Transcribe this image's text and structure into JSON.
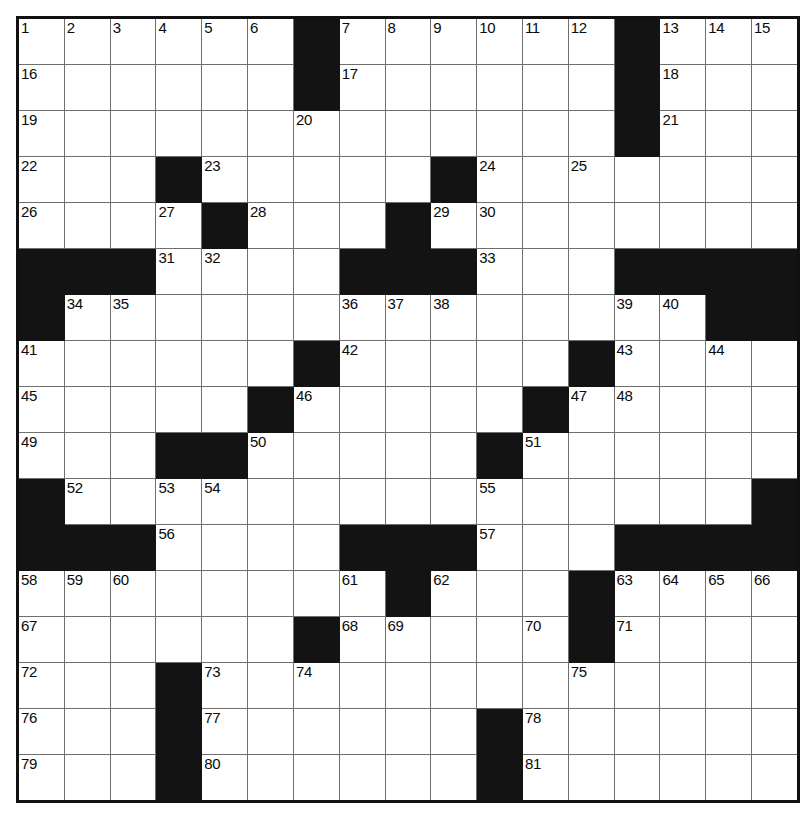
{
  "puzzle": {
    "title": "Crossword Puzzle Grid",
    "rows": 17,
    "cols": 17,
    "cell_size_px": 45,
    "colors": {
      "block": "#131313",
      "cell": "#ffffff",
      "grid_line": "#6f6f6f",
      "border": "#111111",
      "number_text": "#0a0a0a"
    },
    "max_clue_number": 81,
    "legend": {
      "white_cell": "fillable square",
      "black_cell": "blocked square"
    },
    "grid": [
      [
        {
          "t": "w",
          "n": "1"
        },
        {
          "t": "w",
          "n": "2"
        },
        {
          "t": "w",
          "n": "3"
        },
        {
          "t": "w",
          "n": "4"
        },
        {
          "t": "w",
          "n": "5"
        },
        {
          "t": "w",
          "n": "6"
        },
        {
          "t": "b",
          "n": ""
        },
        {
          "t": "w",
          "n": "7"
        },
        {
          "t": "w",
          "n": "8"
        },
        {
          "t": "w",
          "n": "9"
        },
        {
          "t": "w",
          "n": "10"
        },
        {
          "t": "w",
          "n": "11"
        },
        {
          "t": "w",
          "n": "12"
        },
        {
          "t": "b",
          "n": ""
        },
        {
          "t": "w",
          "n": "13"
        },
        {
          "t": "w",
          "n": "14"
        },
        {
          "t": "w",
          "n": "15"
        }
      ],
      [
        {
          "t": "w",
          "n": "16"
        },
        {
          "t": "w",
          "n": ""
        },
        {
          "t": "w",
          "n": ""
        },
        {
          "t": "w",
          "n": ""
        },
        {
          "t": "w",
          "n": ""
        },
        {
          "t": "w",
          "n": ""
        },
        {
          "t": "b",
          "n": ""
        },
        {
          "t": "w",
          "n": "17"
        },
        {
          "t": "w",
          "n": ""
        },
        {
          "t": "w",
          "n": ""
        },
        {
          "t": "w",
          "n": ""
        },
        {
          "t": "w",
          "n": ""
        },
        {
          "t": "w",
          "n": ""
        },
        {
          "t": "b",
          "n": ""
        },
        {
          "t": "w",
          "n": "18"
        },
        {
          "t": "w",
          "n": ""
        },
        {
          "t": "w",
          "n": ""
        }
      ],
      [
        {
          "t": "w",
          "n": "19"
        },
        {
          "t": "w",
          "n": ""
        },
        {
          "t": "w",
          "n": ""
        },
        {
          "t": "w",
          "n": ""
        },
        {
          "t": "w",
          "n": ""
        },
        {
          "t": "w",
          "n": ""
        },
        {
          "t": "w",
          "n": "20"
        },
        {
          "t": "w",
          "n": ""
        },
        {
          "t": "w",
          "n": ""
        },
        {
          "t": "w",
          "n": ""
        },
        {
          "t": "w",
          "n": ""
        },
        {
          "t": "w",
          "n": ""
        },
        {
          "t": "w",
          "n": ""
        },
        {
          "t": "b",
          "n": ""
        },
        {
          "t": "w",
          "n": "21"
        },
        {
          "t": "w",
          "n": ""
        },
        {
          "t": "w",
          "n": ""
        }
      ],
      [
        {
          "t": "w",
          "n": "22"
        },
        {
          "t": "w",
          "n": ""
        },
        {
          "t": "w",
          "n": ""
        },
        {
          "t": "b",
          "n": ""
        },
        {
          "t": "w",
          "n": "23"
        },
        {
          "t": "w",
          "n": ""
        },
        {
          "t": "w",
          "n": ""
        },
        {
          "t": "w",
          "n": ""
        },
        {
          "t": "w",
          "n": ""
        },
        {
          "t": "b",
          "n": ""
        },
        {
          "t": "w",
          "n": "24"
        },
        {
          "t": "w",
          "n": ""
        },
        {
          "t": "w",
          "n": "25"
        },
        {
          "t": "w",
          "n": ""
        },
        {
          "t": "w",
          "n": ""
        },
        {
          "t": "w",
          "n": ""
        },
        {
          "t": "w",
          "n": ""
        }
      ],
      [
        {
          "t": "w",
          "n": "26"
        },
        {
          "t": "w",
          "n": ""
        },
        {
          "t": "w",
          "n": ""
        },
        {
          "t": "w",
          "n": "27"
        },
        {
          "t": "b",
          "n": ""
        },
        {
          "t": "w",
          "n": "28"
        },
        {
          "t": "w",
          "n": ""
        },
        {
          "t": "w",
          "n": ""
        },
        {
          "t": "b",
          "n": ""
        },
        {
          "t": "w",
          "n": "29"
        },
        {
          "t": "w",
          "n": "30"
        },
        {
          "t": "w",
          "n": ""
        },
        {
          "t": "w",
          "n": ""
        },
        {
          "t": "w",
          "n": ""
        },
        {
          "t": "w",
          "n": ""
        },
        {
          "t": "w",
          "n": ""
        },
        {
          "t": "w",
          "n": ""
        }
      ],
      [
        {
          "t": "b",
          "n": ""
        },
        {
          "t": "b",
          "n": ""
        },
        {
          "t": "b",
          "n": ""
        },
        {
          "t": "w",
          "n": "31"
        },
        {
          "t": "w",
          "n": "32"
        },
        {
          "t": "w",
          "n": ""
        },
        {
          "t": "w",
          "n": ""
        },
        {
          "t": "b",
          "n": ""
        },
        {
          "t": "b",
          "n": ""
        },
        {
          "t": "b",
          "n": ""
        },
        {
          "t": "w",
          "n": "33"
        },
        {
          "t": "w",
          "n": ""
        },
        {
          "t": "w",
          "n": ""
        },
        {
          "t": "b",
          "n": ""
        },
        {
          "t": "b",
          "n": ""
        },
        {
          "t": "b",
          "n": ""
        },
        {
          "t": "b",
          "n": ""
        }
      ],
      [
        {
          "t": "b",
          "n": ""
        },
        {
          "t": "w",
          "n": "34"
        },
        {
          "t": "w",
          "n": "35"
        },
        {
          "t": "w",
          "n": ""
        },
        {
          "t": "w",
          "n": ""
        },
        {
          "t": "w",
          "n": ""
        },
        {
          "t": "w",
          "n": ""
        },
        {
          "t": "w",
          "n": "36"
        },
        {
          "t": "w",
          "n": "37"
        },
        {
          "t": "w",
          "n": "38"
        },
        {
          "t": "w",
          "n": ""
        },
        {
          "t": "w",
          "n": ""
        },
        {
          "t": "w",
          "n": ""
        },
        {
          "t": "w",
          "n": "39"
        },
        {
          "t": "w",
          "n": "40"
        },
        {
          "t": "b",
          "n": ""
        },
        {
          "t": "b",
          "n": ""
        }
      ],
      [
        {
          "t": "w",
          "n": "41"
        },
        {
          "t": "w",
          "n": ""
        },
        {
          "t": "w",
          "n": ""
        },
        {
          "t": "w",
          "n": ""
        },
        {
          "t": "w",
          "n": ""
        },
        {
          "t": "w",
          "n": ""
        },
        {
          "t": "b",
          "n": ""
        },
        {
          "t": "w",
          "n": "42"
        },
        {
          "t": "w",
          "n": ""
        },
        {
          "t": "w",
          "n": ""
        },
        {
          "t": "w",
          "n": ""
        },
        {
          "t": "w",
          "n": ""
        },
        {
          "t": "b",
          "n": ""
        },
        {
          "t": "w",
          "n": "43"
        },
        {
          "t": "w",
          "n": ""
        },
        {
          "t": "w",
          "n": "44"
        },
        {
          "t": "w",
          "n": ""
        }
      ],
      [
        {
          "t": "w",
          "n": "45"
        },
        {
          "t": "w",
          "n": ""
        },
        {
          "t": "w",
          "n": ""
        },
        {
          "t": "w",
          "n": ""
        },
        {
          "t": "w",
          "n": ""
        },
        {
          "t": "b",
          "n": ""
        },
        {
          "t": "w",
          "n": "46"
        },
        {
          "t": "w",
          "n": ""
        },
        {
          "t": "w",
          "n": ""
        },
        {
          "t": "w",
          "n": ""
        },
        {
          "t": "w",
          "n": ""
        },
        {
          "t": "b",
          "n": ""
        },
        {
          "t": "w",
          "n": "47"
        },
        {
          "t": "w",
          "n": "48"
        },
        {
          "t": "w",
          "n": ""
        },
        {
          "t": "w",
          "n": ""
        },
        {
          "t": "w",
          "n": ""
        }
      ],
      [
        {
          "t": "w",
          "n": "49"
        },
        {
          "t": "w",
          "n": ""
        },
        {
          "t": "w",
          "n": ""
        },
        {
          "t": "b",
          "n": ""
        },
        {
          "t": "b",
          "n": ""
        },
        {
          "t": "w",
          "n": "50"
        },
        {
          "t": "w",
          "n": ""
        },
        {
          "t": "w",
          "n": ""
        },
        {
          "t": "w",
          "n": ""
        },
        {
          "t": "w",
          "n": ""
        },
        {
          "t": "b",
          "n": ""
        },
        {
          "t": "w",
          "n": "51"
        },
        {
          "t": "w",
          "n": ""
        },
        {
          "t": "w",
          "n": ""
        },
        {
          "t": "w",
          "n": ""
        },
        {
          "t": "w",
          "n": ""
        },
        {
          "t": "w",
          "n": ""
        }
      ],
      [
        {
          "t": "b",
          "n": ""
        },
        {
          "t": "w",
          "n": "52"
        },
        {
          "t": "w",
          "n": ""
        },
        {
          "t": "w",
          "n": "53"
        },
        {
          "t": "w",
          "n": "54"
        },
        {
          "t": "w",
          "n": ""
        },
        {
          "t": "w",
          "n": ""
        },
        {
          "t": "w",
          "n": ""
        },
        {
          "t": "w",
          "n": ""
        },
        {
          "t": "w",
          "n": ""
        },
        {
          "t": "w",
          "n": "55"
        },
        {
          "t": "w",
          "n": ""
        },
        {
          "t": "w",
          "n": ""
        },
        {
          "t": "w",
          "n": ""
        },
        {
          "t": "w",
          "n": ""
        },
        {
          "t": "w",
          "n": ""
        },
        {
          "t": "b",
          "n": ""
        }
      ],
      [
        {
          "t": "b",
          "n": ""
        },
        {
          "t": "b",
          "n": ""
        },
        {
          "t": "b",
          "n": ""
        },
        {
          "t": "w",
          "n": "56"
        },
        {
          "t": "w",
          "n": ""
        },
        {
          "t": "w",
          "n": ""
        },
        {
          "t": "w",
          "n": ""
        },
        {
          "t": "b",
          "n": ""
        },
        {
          "t": "b",
          "n": ""
        },
        {
          "t": "b",
          "n": ""
        },
        {
          "t": "w",
          "n": "57"
        },
        {
          "t": "w",
          "n": ""
        },
        {
          "t": "w",
          "n": ""
        },
        {
          "t": "b",
          "n": ""
        },
        {
          "t": "b",
          "n": ""
        },
        {
          "t": "b",
          "n": ""
        },
        {
          "t": "b",
          "n": ""
        }
      ],
      [
        {
          "t": "w",
          "n": "58"
        },
        {
          "t": "w",
          "n": "59"
        },
        {
          "t": "w",
          "n": "60"
        },
        {
          "t": "w",
          "n": ""
        },
        {
          "t": "w",
          "n": ""
        },
        {
          "t": "w",
          "n": ""
        },
        {
          "t": "w",
          "n": ""
        },
        {
          "t": "w",
          "n": "61"
        },
        {
          "t": "b",
          "n": ""
        },
        {
          "t": "w",
          "n": "62"
        },
        {
          "t": "w",
          "n": ""
        },
        {
          "t": "w",
          "n": ""
        },
        {
          "t": "b",
          "n": ""
        },
        {
          "t": "w",
          "n": "63"
        },
        {
          "t": "w",
          "n": "64"
        },
        {
          "t": "w",
          "n": "65"
        },
        {
          "t": "w",
          "n": "66"
        }
      ],
      [
        {
          "t": "w",
          "n": "67"
        },
        {
          "t": "w",
          "n": ""
        },
        {
          "t": "w",
          "n": ""
        },
        {
          "t": "w",
          "n": ""
        },
        {
          "t": "w",
          "n": ""
        },
        {
          "t": "w",
          "n": ""
        },
        {
          "t": "b",
          "n": ""
        },
        {
          "t": "w",
          "n": "68"
        },
        {
          "t": "w",
          "n": "69"
        },
        {
          "t": "w",
          "n": ""
        },
        {
          "t": "w",
          "n": ""
        },
        {
          "t": "w",
          "n": "70"
        },
        {
          "t": "b",
          "n": ""
        },
        {
          "t": "w",
          "n": "71"
        },
        {
          "t": "w",
          "n": ""
        },
        {
          "t": "w",
          "n": ""
        },
        {
          "t": "w",
          "n": ""
        }
      ],
      [
        {
          "t": "w",
          "n": "72"
        },
        {
          "t": "w",
          "n": ""
        },
        {
          "t": "w",
          "n": ""
        },
        {
          "t": "b",
          "n": ""
        },
        {
          "t": "w",
          "n": "73"
        },
        {
          "t": "w",
          "n": ""
        },
        {
          "t": "w",
          "n": "74"
        },
        {
          "t": "w",
          "n": ""
        },
        {
          "t": "w",
          "n": ""
        },
        {
          "t": "w",
          "n": ""
        },
        {
          "t": "w",
          "n": ""
        },
        {
          "t": "w",
          "n": ""
        },
        {
          "t": "w",
          "n": "75"
        },
        {
          "t": "w",
          "n": ""
        },
        {
          "t": "w",
          "n": ""
        },
        {
          "t": "w",
          "n": ""
        },
        {
          "t": "w",
          "n": ""
        }
      ],
      [
        {
          "t": "w",
          "n": "76"
        },
        {
          "t": "w",
          "n": ""
        },
        {
          "t": "w",
          "n": ""
        },
        {
          "t": "b",
          "n": ""
        },
        {
          "t": "w",
          "n": "77"
        },
        {
          "t": "w",
          "n": ""
        },
        {
          "t": "w",
          "n": ""
        },
        {
          "t": "w",
          "n": ""
        },
        {
          "t": "w",
          "n": ""
        },
        {
          "t": "w",
          "n": ""
        },
        {
          "t": "b",
          "n": ""
        },
        {
          "t": "w",
          "n": "78"
        },
        {
          "t": "w",
          "n": ""
        },
        {
          "t": "w",
          "n": ""
        },
        {
          "t": "w",
          "n": ""
        },
        {
          "t": "w",
          "n": ""
        },
        {
          "t": "w",
          "n": ""
        }
      ],
      [
        {
          "t": "w",
          "n": "79"
        },
        {
          "t": "w",
          "n": ""
        },
        {
          "t": "w",
          "n": ""
        },
        {
          "t": "b",
          "n": ""
        },
        {
          "t": "w",
          "n": "80"
        },
        {
          "t": "w",
          "n": ""
        },
        {
          "t": "w",
          "n": ""
        },
        {
          "t": "w",
          "n": ""
        },
        {
          "t": "w",
          "n": ""
        },
        {
          "t": "w",
          "n": ""
        },
        {
          "t": "b",
          "n": ""
        },
        {
          "t": "w",
          "n": "81"
        },
        {
          "t": "w",
          "n": ""
        },
        {
          "t": "w",
          "n": ""
        },
        {
          "t": "w",
          "n": ""
        },
        {
          "t": "w",
          "n": ""
        },
        {
          "t": "w",
          "n": ""
        }
      ]
    ]
  }
}
